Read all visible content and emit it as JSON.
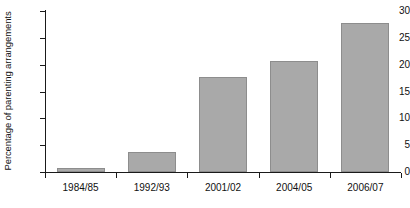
{
  "chart_data": {
    "type": "bar",
    "title": "",
    "subtitle": "",
    "xlabel": "",
    "ylabel": "Percentage of parenting arrangements",
    "categories": [
      "1984/85",
      "1992/93",
      "2001/02",
      "2004/05",
      "2006/07"
    ],
    "values": [
      0.8,
      3.7,
      17.7,
      20.7,
      27.7
    ],
    "series": [
      {
        "name": "Percentage of parenting arrangements",
        "values": [
          0.8,
          3.7,
          17.7,
          20.7,
          27.7
        ]
      }
    ],
    "ylim": [
      0,
      30
    ],
    "ytick_labels": [
      "0",
      "5",
      "10",
      "15",
      "20",
      "25",
      "30"
    ],
    "ytick_values": [
      0,
      5,
      10,
      15,
      20,
      25,
      30
    ],
    "grid": false,
    "legend": false,
    "legend_position": "none",
    "bar_color": "#a9a9a9",
    "bar_border_color": "#8d8d8d",
    "axis_color": "#1a1a1a",
    "background_color": "#ffffff"
  }
}
